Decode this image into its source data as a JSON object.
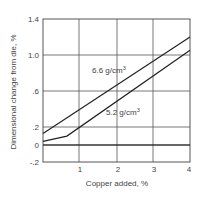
{
  "chart_data": {
    "type": "line",
    "title": "",
    "xlabel": "Copper added, %",
    "ylabel": "Dimensional change from die, %",
    "xlim": [
      0,
      4
    ],
    "ylim": [
      -0.2,
      1.4
    ],
    "x_ticks": [
      "1",
      "2",
      "3",
      "4"
    ],
    "y_ticks": [
      "1.4",
      "1.0",
      ".6",
      ".2",
      "0",
      "-.2"
    ],
    "grid": true,
    "legend": "inline labels",
    "series": [
      {
        "name": "6.6 g/cm³",
        "label_main": "6.6 g/cm",
        "label_sup": "3",
        "x": [
          0,
          4
        ],
        "y": [
          0.12,
          1.2
        ]
      },
      {
        "name": "5.2 g/cm³",
        "label_main": "5.2 g/cm",
        "label_sup": "3",
        "x": [
          0,
          0.65,
          4
        ],
        "y": [
          0.03,
          0.09,
          1.05
        ]
      }
    ]
  }
}
